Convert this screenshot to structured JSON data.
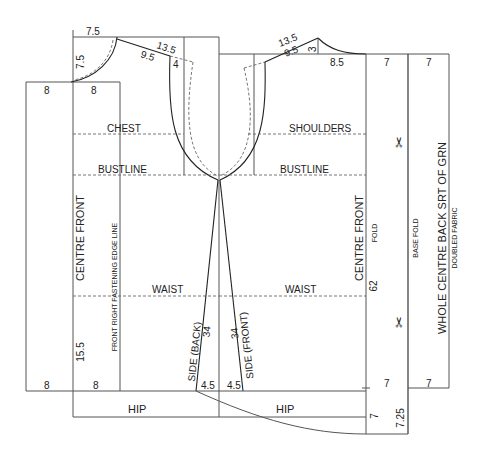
{
  "diagram": {
    "type": "sewing-pattern-draft",
    "guide_lines": {
      "chest": "CHEST",
      "shoulders": "SHOULDERS",
      "bustline_left": "BUSTLINE",
      "bustline_right": "BUSTLINE",
      "waist_left": "WAIST",
      "waist_right": "WAIST",
      "hip_left": "HIP",
      "hip_right": "HIP"
    },
    "vertical_labels": {
      "centre_front_left": "CENTRE FRONT",
      "front_right_fastening": "FRONT RIGHT FASTENING EDGE LINE",
      "side_back": "SIDE (BACK)",
      "side_front": "SIDE (FRONT)",
      "centre_front_right": "CENTRE FRONT",
      "fold": "FOLD",
      "base_fold": "BASE FOLD",
      "whole_centre_back": "WHOLE CENTRE BACK SRT OF GRN",
      "doubled_fabric": "DOUBLED FABRIC"
    },
    "measurements": {
      "neck_width_front": "7.5",
      "neck_depth_front": "7.5",
      "shoulder_front": "13.5",
      "shoulder_inner_front": "9.5",
      "shoulder_drop_front": "4",
      "ext_top_left": "8",
      "ext_top_right": "8",
      "ext_bottom_left": "8",
      "ext_bottom_right": "8",
      "front_hem_depth": "15.5",
      "side_back_len": "34",
      "side_front_len": "34",
      "hem_flare_back": "4.5",
      "hem_flare_front": "4.5",
      "shoulder_back": "13.5",
      "shoulder_inner_back": "9.5",
      "shoulder_drop_back": "3",
      "neck_width_back": "8.5",
      "fold_top_a": "7",
      "fold_top_b": "7",
      "centre_length": "62",
      "fold_bottom_a": "7",
      "fold_bottom_b": "7",
      "hem_drop_a": "7",
      "hem_drop_b": "7.25"
    },
    "icons": {
      "scissors_top": "✂",
      "scissors_bottom": "✂"
    }
  }
}
